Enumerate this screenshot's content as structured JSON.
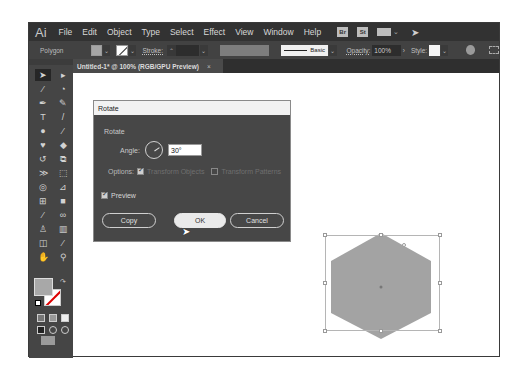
{
  "app": {
    "logo": "Ai",
    "menu": [
      "File",
      "Edit",
      "Object",
      "Type",
      "Select",
      "Effect",
      "View",
      "Window",
      "Help"
    ],
    "menu_icons": [
      "Br",
      "St"
    ]
  },
  "control_bar": {
    "selection_label": "Polygon",
    "stroke_label": "Stroke:",
    "stroke_weight": "",
    "profile_label": "Basic",
    "opacity_label": "Opacity:",
    "opacity_value": "100%",
    "style_label": "Style:",
    "colors": {
      "fill": "#a6a6a6",
      "stroke": "#ffffff"
    }
  },
  "document_tab": {
    "title": "Untitled-1* @ 100% (RGB/GPU Preview)",
    "close": "×"
  },
  "toolbar": {
    "tools": [
      "selection",
      "direct-selection",
      "magic-wand",
      "lasso",
      "pen",
      "curvature",
      "type",
      "line-segment",
      "ellipse",
      "paintbrush",
      "shaper",
      "eraser",
      "rotate",
      "scale",
      "width",
      "free-transform",
      "shape-builder",
      "perspective-grid",
      "mesh",
      "gradient",
      "eyedropper",
      "blend",
      "symbol-sprayer",
      "column-graph",
      "artboard",
      "slice",
      "hand",
      "zoom"
    ],
    "fill_color": "#a8a8a8"
  },
  "dialog": {
    "title": "Rotate",
    "section": "Rotate",
    "angle_label": "Angle:",
    "angle_value": "30°",
    "options_label": "Options:",
    "transform_objects": "Transform Objects",
    "transform_patterns": "Transform Patterns",
    "preview_label": "Preview",
    "copy_label": "Copy",
    "ok_label": "OK",
    "cancel_label": "Cancel"
  },
  "canvas": {
    "shape": "hexagon",
    "shape_fill": "#a3a3a3"
  }
}
